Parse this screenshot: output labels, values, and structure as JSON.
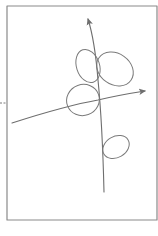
{
  "diagram": {
    "title": "",
    "description": "Hand-sketched coordinate diagram: framed panel with a curved upward vertical axis and a curved rightward horizontal axis, four ellipses, and a dashed tick outside the left border.",
    "colors": {
      "background": "#ffffff",
      "frame": "#8a8a8a",
      "axis": "#6e6e6e",
      "ellipse": "#7a7a7a",
      "dash": "#7a7a7a"
    },
    "frame": {
      "x": 7,
      "y": 6,
      "width": 150,
      "height": 214,
      "stroke_width": 1.2
    },
    "dash_tick": {
      "x1": 0,
      "y1": 103,
      "x2": 7,
      "y2": 103
    },
    "axes": [
      {
        "id": "vertical-axis",
        "path": "M104,192 C103,150 101,110 98,80 C96,55 93,35 88,19",
        "arrow_tip": {
          "x": 88,
          "y": 17
        },
        "direction": "up"
      },
      {
        "id": "horizontal-axis",
        "path": "M12,123 C40,114 70,105 98,100 C115,96 132,93 145,91",
        "arrow_tip": {
          "x": 147,
          "y": 91
        },
        "direction": "right"
      }
    ],
    "ellipses": [
      {
        "id": "ellipse-upper-left",
        "cx": 88,
        "cy": 66,
        "rx": 11.5,
        "ry": 17,
        "rotate": -18
      },
      {
        "id": "ellipse-upper-right",
        "cx": 115,
        "cy": 69,
        "rx": 19.5,
        "ry": 15.5,
        "rotate": 35
      },
      {
        "id": "ellipse-center-left",
        "cx": 83,
        "cy": 100,
        "rx": 16.5,
        "ry": 15.5,
        "rotate": -20
      },
      {
        "id": "ellipse-lower",
        "cx": 116,
        "cy": 147,
        "rx": 14,
        "ry": 10.5,
        "rotate": -30
      }
    ]
  }
}
